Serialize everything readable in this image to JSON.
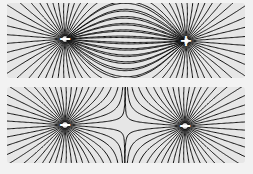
{
  "diagrams": [
    {
      "title": "Opposite charges (dipole)",
      "charges": [
        {
          "sign": "-",
          "label": "−",
          "x": 58,
          "y": 36
        },
        {
          "sign": "+",
          "label": "+",
          "x": 179,
          "y": 38
        }
      ]
    },
    {
      "title": "Like charges (two negatives)",
      "charges": [
        {
          "sign": "-",
          "label": "−",
          "x": 58,
          "y": 38
        },
        {
          "sign": "-",
          "label": "−",
          "x": 178,
          "y": 39
        }
      ]
    }
  ],
  "colors": {
    "line": "#111111",
    "background": "#e6e6e6",
    "page": "#f2f2f2",
    "charge_label": "#ffffff"
  }
}
